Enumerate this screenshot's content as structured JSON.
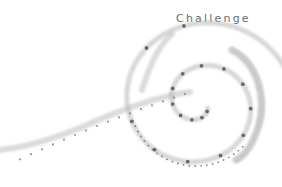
{
  "title": "Challenge",
  "colors": {
    "background": "#ffffff",
    "text": "#6a6a6a",
    "dot": "#555555",
    "stroke": "#b8b8b8",
    "stroke_dark": "#8a8a8a"
  },
  "icon": "spiral-illustration"
}
